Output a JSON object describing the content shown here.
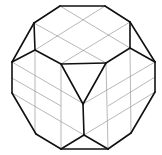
{
  "figure": {
    "colors": {
      "edge": "#111111",
      "grid": "#9a9a9a",
      "background": "#ffffff"
    },
    "vertices": {
      "A": [
        60,
        6
      ],
      "B": [
        105,
        6
      ],
      "C": [
        34,
        23
      ],
      "D": [
        130,
        22
      ],
      "E": [
        12,
        62
      ],
      "F": [
        155,
        62
      ],
      "G": [
        35,
        50
      ],
      "H": [
        130,
        48
      ],
      "T1": [
        61,
        64
      ],
      "T2": [
        106,
        63
      ],
      "T3": [
        83,
        104
      ],
      "E2": [
        12,
        93
      ],
      "F2": [
        155,
        92
      ],
      "L": [
        36,
        134
      ],
      "R": [
        131,
        133
      ],
      "BL": [
        61,
        149
      ],
      "BR": [
        108,
        149
      ],
      "BC": [
        84,
        135
      ]
    },
    "bold_edges": [
      [
        "A",
        "B"
      ],
      [
        "B",
        "D"
      ],
      [
        "D",
        "F"
      ],
      [
        "F",
        "F2"
      ],
      [
        "F2",
        "R"
      ],
      [
        "R",
        "BR"
      ],
      [
        "BR",
        "BL"
      ],
      [
        "BL",
        "L"
      ],
      [
        "L",
        "E2"
      ],
      [
        "E2",
        "E"
      ],
      [
        "E",
        "C"
      ],
      [
        "C",
        "A"
      ],
      [
        "C",
        "G"
      ],
      [
        "G",
        "E"
      ],
      [
        "D",
        "H"
      ],
      [
        "H",
        "F"
      ],
      [
        "G",
        "T1"
      ],
      [
        "H",
        "T2"
      ],
      [
        "T1",
        "T2"
      ],
      [
        "T1",
        "T3"
      ],
      [
        "T2",
        "T3"
      ],
      [
        "T3",
        "BC"
      ],
      [
        "BC",
        "BL"
      ],
      [
        "BC",
        "BR"
      ]
    ],
    "grid_lines": [
      [
        [
          60,
          6
        ],
        [
          130,
          48
        ]
      ],
      [
        [
          105,
          6
        ],
        [
          35,
          50
        ]
      ],
      [
        [
          34,
          23
        ],
        [
          106,
          63
        ]
      ],
      [
        [
          130,
          22
        ],
        [
          61,
          64
        ]
      ],
      [
        [
          35,
          50
        ],
        [
          35,
          134
        ]
      ],
      [
        [
          130,
          48
        ],
        [
          131,
          133
        ]
      ],
      [
        [
          61,
          64
        ],
        [
          61,
          149
        ]
      ],
      [
        [
          106,
          63
        ],
        [
          108,
          149
        ]
      ],
      [
        [
          12,
          62
        ],
        [
          84,
          104
        ]
      ],
      [
        [
          155,
          62
        ],
        [
          83,
          104
        ]
      ],
      [
        [
          12,
          93
        ],
        [
          84,
          135
        ]
      ],
      [
        [
          155,
          92
        ],
        [
          84,
          135
        ]
      ],
      [
        [
          12,
          78
        ],
        [
          61,
          106
        ]
      ],
      [
        [
          155,
          77
        ],
        [
          108,
          106
        ]
      ]
    ]
  }
}
